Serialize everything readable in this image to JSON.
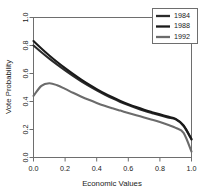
{
  "chart_data": {
    "type": "line",
    "title": "",
    "xlabel": "Economic Values",
    "ylabel": "Vote Probability",
    "xlim": [
      0.0,
      1.0
    ],
    "ylim": [
      0.0,
      1.0
    ],
    "xticks": [
      "0.0",
      "0.2",
      "0.4",
      "0.6",
      "0.8",
      "1.0"
    ],
    "xtick_values": [
      0.0,
      0.2,
      0.4,
      0.6,
      0.8,
      1.0
    ],
    "yticks": [
      "0.0",
      "0.2",
      "0.4",
      "0.6",
      "0.8",
      "1.0"
    ],
    "ytick_values": [
      0.0,
      0.2,
      0.4,
      0.6,
      0.8,
      1.0
    ],
    "grid": false,
    "legend_position": "top-right",
    "x": [
      0.0,
      0.05,
      0.1,
      0.15,
      0.2,
      0.25,
      0.3,
      0.35,
      0.4,
      0.45,
      0.5,
      0.55,
      0.6,
      0.65,
      0.7,
      0.75,
      0.8,
      0.85,
      0.9,
      0.95,
      1.0
    ],
    "series": [
      {
        "name": "1984",
        "color": "#2b2b2b",
        "values": [
          0.8,
          0.752,
          0.706,
          0.663,
          0.622,
          0.583,
          0.546,
          0.512,
          0.48,
          0.45,
          0.422,
          0.397,
          0.374,
          0.353,
          0.334,
          0.317,
          0.301,
          0.286,
          0.272,
          0.225,
          0.128
        ]
      },
      {
        "name": "1988",
        "color": "#1a1a1a",
        "values": [
          0.832,
          0.779,
          0.729,
          0.682,
          0.638,
          0.597,
          0.558,
          0.522,
          0.489,
          0.458,
          0.43,
          0.404,
          0.381,
          0.36,
          0.341,
          0.324,
          0.308,
          0.292,
          0.276,
          0.23,
          0.132
        ]
      },
      {
        "name": "1992",
        "color": "#6b6b6b",
        "values": [
          0.44,
          0.512,
          0.53,
          0.516,
          0.49,
          0.462,
          0.436,
          0.412,
          0.39,
          0.37,
          0.352,
          0.335,
          0.318,
          0.302,
          0.286,
          0.27,
          0.253,
          0.234,
          0.212,
          0.176,
          0.042
        ]
      }
    ]
  },
  "legend": {
    "entries": [
      {
        "label": "1984"
      },
      {
        "label": "1988"
      },
      {
        "label": "1992"
      }
    ]
  },
  "axes": {
    "x_title": "Economic Values",
    "y_title": "Vote Probability"
  }
}
